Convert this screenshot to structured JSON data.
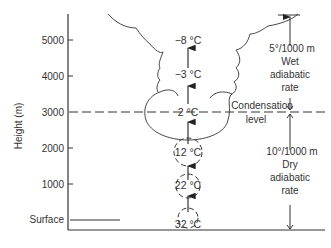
{
  "axis": {
    "ylabel": "Height (m)",
    "ticks": [
      {
        "label": "5000",
        "y": 40
      },
      {
        "label": "4000",
        "y": 76
      },
      {
        "label": "3000",
        "y": 112
      },
      {
        "label": "2000",
        "y": 148
      },
      {
        "label": "1000",
        "y": 184
      }
    ],
    "surface_label": "Surface"
  },
  "parcels": [
    {
      "temp": "32 °C",
      "height_m": 0
    },
    {
      "temp": "22 °C",
      "height_m": 1000
    },
    {
      "temp": "12 °C",
      "height_m": 2000
    },
    {
      "temp": "2 °C",
      "height_m": 3000
    },
    {
      "temp": "−3 °C",
      "height_m": 4000
    },
    {
      "temp": "−8 °C",
      "height_m": 5000
    }
  ],
  "condensation": {
    "line1": "Condensation",
    "line2": "level",
    "height_m": 3000
  },
  "wet_rate": {
    "rate": "5°/1000 m",
    "line1": "Wet",
    "line2": "adiabatic",
    "line3": "rate"
  },
  "dry_rate": {
    "rate": "10°/1000 m",
    "line1": "Dry",
    "line2": "adiabatic",
    "line3": "rate"
  },
  "colors": {
    "ink": "#333333",
    "background": "#ffffff"
  }
}
